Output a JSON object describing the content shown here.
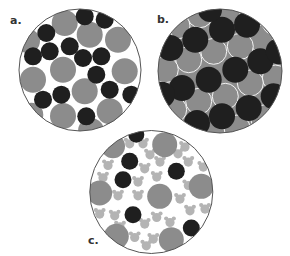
{
  "figure": {
    "colors": {
      "background": "#ffffff",
      "outline": "#555555",
      "large_gray": "#8c8c8c",
      "dark": "#1f1f1f",
      "light_bear": "#b4b4b4",
      "panel_b_fill": "#8c8c8c"
    },
    "panels": [
      {
        "id": "a",
        "label": "a.",
        "label_pos": [
          10,
          15
        ],
        "circle": {
          "cx": 80,
          "cy": 70,
          "r": 61
        },
        "large_gray": [
          [
            64.7,
            23,
            13
          ],
          [
            89.7,
            34.7,
            13
          ],
          [
            118,
            39.7,
            13
          ],
          [
            28,
            41,
            12
          ],
          [
            63,
            69.7,
            13
          ],
          [
            124.7,
            71.3,
            13
          ],
          [
            33,
            79.7,
            13
          ],
          [
            84.7,
            91.3,
            13
          ],
          [
            63,
            116,
            13
          ],
          [
            109.7,
            111.3,
            13
          ],
          [
            31.3,
            114.7,
            12
          ],
          [
            91,
            131,
            13
          ]
        ],
        "dark": [
          [
            84.7,
            16.3,
            9
          ],
          [
            104.7,
            19.7,
            9
          ],
          [
            46.3,
            33,
            9
          ],
          [
            33,
            56.3,
            9
          ],
          [
            49.7,
            51.3,
            9
          ],
          [
            69.7,
            46.3,
            9
          ],
          [
            83,
            58,
            9
          ],
          [
            101.3,
            56.3,
            9
          ],
          [
            96.3,
            74.7,
            9
          ],
          [
            109.7,
            89.7,
            9
          ],
          [
            131.3,
            94.7,
            9
          ],
          [
            61.3,
            94.7,
            9
          ],
          [
            43,
            99.7,
            9
          ],
          [
            86.3,
            116.3,
            9
          ]
        ]
      },
      {
        "id": "b",
        "label": "b.",
        "label_pos": [
          157,
          14
        ],
        "circle": {
          "cx": 220,
          "cy": 71,
          "r": 62
        },
        "large_gray": [
          [
            200,
            14.7,
            13
          ],
          [
            227,
            13,
            13
          ],
          [
            177,
            26,
            13
          ],
          [
            260,
            38,
            13
          ],
          [
            213.7,
            51.3,
            13
          ],
          [
            240.3,
            46.3,
            13
          ],
          [
            188.7,
            59.7,
            13
          ],
          [
            165.3,
            69.7,
            13
          ],
          [
            275.3,
            78,
            13
          ],
          [
            250.3,
            83,
            13
          ],
          [
            225.3,
            96.3,
            13
          ],
          [
            198.7,
            101.3,
            13
          ],
          [
            173.7,
            109.7,
            13
          ],
          [
            263.7,
            118,
            13
          ],
          [
            237,
            128,
            13
          ],
          [
            275,
            22,
            13
          ],
          [
            160,
            40,
            13
          ],
          [
            282,
            110,
            13
          ]
        ],
        "dark": [
          [
            195.3,
            39.7,
            13
          ],
          [
            222,
            29.7,
            13
          ],
          [
            247,
            24.7,
            13
          ],
          [
            170.3,
            48,
            13
          ],
          [
            235.3,
            69.7,
            13
          ],
          [
            260.3,
            61.3,
            13
          ],
          [
            208.7,
            79.7,
            13
          ],
          [
            182,
            88,
            13
          ],
          [
            162,
            94.7,
            13
          ],
          [
            222,
            116.3,
            13
          ],
          [
            248.7,
            108,
            13
          ],
          [
            273.7,
            96.3,
            13
          ],
          [
            197,
            123,
            13
          ],
          [
            278.7,
            51.3,
            13
          ],
          [
            210,
            10,
            12
          ]
        ]
      },
      {
        "id": "c",
        "label": "c.",
        "label_pos": [
          88,
          235
        ],
        "circle": {
          "cx": 151.3,
          "cy": 192,
          "r": 61.5
        },
        "large_gray": [
          [
            164.7,
            144.7,
            12.5
          ],
          [
            113,
            146.3,
            12
          ],
          [
            99.7,
            193,
            12.5
          ],
          [
            159.7,
            196.3,
            12.5
          ],
          [
            201.3,
            186.3,
            12.5
          ],
          [
            116.3,
            236.3,
            12.5
          ],
          [
            171.3,
            239.7,
            12.5
          ]
        ],
        "dark": [
          [
            129.7,
            161.3,
            8.5
          ],
          [
            123,
            179.7,
            8.5
          ],
          [
            176.3,
            171.3,
            8.5
          ],
          [
            133,
            214.7,
            8.5
          ],
          [
            191.3,
            228,
            8.5
          ],
          [
            136.3,
            134.7,
            8
          ]
        ],
        "bears": [
          [
            129.7,
            143
          ],
          [
            143,
            143
          ],
          [
            108,
            164.7
          ],
          [
            103,
            177
          ],
          [
            144.7,
            168
          ],
          [
            138,
            181.3
          ],
          [
            185,
            146.3
          ],
          [
            160,
            161.3
          ],
          [
            188.3,
            161.3
          ],
          [
            203.3,
            166.3
          ],
          [
            156.7,
            176.3
          ],
          [
            188.3,
            184.7
          ],
          [
            118,
            195
          ],
          [
            138,
            195
          ],
          [
            99.7,
            213.3
          ],
          [
            114.7,
            215
          ],
          [
            144.7,
            223.3
          ],
          [
            134.7,
            236.7
          ],
          [
            146.3,
            245
          ],
          [
            180,
            198.3
          ],
          [
            190,
            210
          ],
          [
            205,
            208.3
          ],
          [
            156.7,
            216.7
          ],
          [
            170,
            221.7
          ],
          [
            153.3,
            238.3
          ],
          [
            178,
            153
          ],
          [
            150,
            154
          ],
          [
            120,
            226
          ]
        ]
      }
    ]
  }
}
